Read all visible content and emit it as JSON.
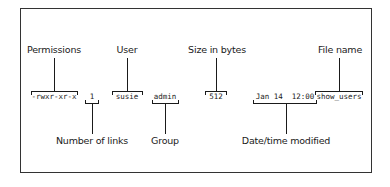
{
  "diagram": {
    "listing_fields": {
      "permissions": "-rwxr-xr-x",
      "links": "1",
      "user": "susie",
      "group": "admin",
      "size": "512",
      "datetime": "Jan 14  12:00",
      "filename": "show_users"
    },
    "labels_top": {
      "permissions": "Permissions",
      "user": "User",
      "size": "Size in bytes",
      "filename": "File name"
    },
    "labels_bottom": {
      "links": "Number of links",
      "group": "Group",
      "datetime": "Date/time modified"
    },
    "colors": {
      "line": "#1a1a1a",
      "frame": "#333333",
      "background": "#ffffff"
    }
  }
}
